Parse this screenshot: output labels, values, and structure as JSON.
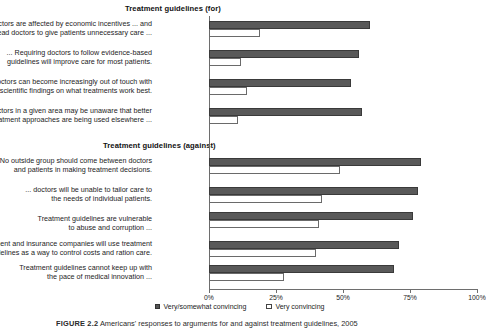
{
  "chart_data": {
    "type": "bar",
    "orientation": "horizontal",
    "title": "",
    "xlabel": "",
    "ylabel": "",
    "xlim": [
      0,
      100
    ],
    "xticks": [
      "0%",
      "25%",
      "50%",
      "75%",
      "100%"
    ],
    "xtick_values": [
      0,
      25,
      50,
      75,
      100
    ],
    "grid": false,
    "legend_position": "bottom-center",
    "series": [
      {
        "name": "Very/somewhat convincing",
        "color": "#595959",
        "style": "filled"
      },
      {
        "name": "Very convincing",
        "color": "#ffffff",
        "style": "outline"
      }
    ],
    "sections": [
      {
        "heading": "Treatment guidelines (for)",
        "categories": [
          "... doctors are affected by economic incentives ... and this can lead doctors to give patients unnecessary care ...",
          "... Requiring doctors to follow evidence-based guidelines will improve care for most patients.",
          "... doctors can become increasingly out of touch with the latest scientific findings on what treatments work best.",
          "... doctors in a given area may be unaware that better treatment approaches are being used elsewhere ..."
        ],
        "very_somewhat_convincing": [
          60,
          56,
          53,
          57
        ],
        "very_convincing": [
          19,
          12,
          14,
          11
        ]
      },
      {
        "heading": "Treatment guidelines (against)",
        "categories": [
          "No outside group should come between doctors and patients in making treatment decisions.",
          "... doctors will be unable to tailor care to the needs of individual patients.",
          "Treatment guidelines are vulnerable to abuse and corruption ...",
          "The government and insurance companies will use treatment guidelines as a way to control costs and ration care.",
          "Treatment guidelines cannot keep up with the pace of medical innovation ..."
        ],
        "very_somewhat_convincing": [
          79,
          78,
          76,
          71,
          69
        ],
        "very_convincing": [
          49,
          42,
          41,
          40,
          28
        ]
      }
    ]
  },
  "sections": {
    "for": {
      "heading": "Treatment guidelines (for)"
    },
    "against": {
      "heading": "Treatment guidelines (against)"
    }
  },
  "labels": {
    "for": [
      {
        "line1": "... doctors are affected by economic incentives ... and",
        "line2": "this can lead doctors to give patients unnecessary care ..."
      },
      {
        "line1": "... Requiring doctors to follow evidence-based",
        "line2": "guidelines will improve care for most patients."
      },
      {
        "line1": "... doctors can become increasingly out of touch with",
        "line2": "the latest scientific findings on what treatments work best."
      },
      {
        "line1": "... doctors in a given area may be unaware that better",
        "line2": "treatment approaches are being used elsewhere ..."
      }
    ],
    "against": [
      {
        "line1": "No outside group should come between doctors",
        "line2": "and patients in making treatment decisions."
      },
      {
        "line1": "... doctors will be unable to tailor care to",
        "line2": "the needs of individual patients."
      },
      {
        "line1": "Treatment guidelines are vulnerable",
        "line2": "to abuse and corruption ..."
      },
      {
        "line1": "The government and insurance companies will use treatment",
        "line2": "guidelines as a way to control costs and ration care."
      },
      {
        "line1": "Treatment guidelines cannot keep up with",
        "line2": "the pace of medical innovation ..."
      }
    ]
  },
  "axis": {
    "ticks": [
      "0%",
      "25%",
      "50%",
      "75%",
      "100%"
    ]
  },
  "legend": {
    "items": [
      {
        "label": "Very/somewhat convincing"
      },
      {
        "label": "Very convincing"
      }
    ]
  },
  "caption": {
    "figure_number": "FIGURE 2.2",
    "text": "Americans' responses to arguments for and against treatment guidelines, 2005"
  },
  "colors": {
    "bar_dark": "#595959",
    "bar_outline": "#6a6a6a",
    "axis": "#6e6e6e",
    "text": "#1d1d1d"
  }
}
